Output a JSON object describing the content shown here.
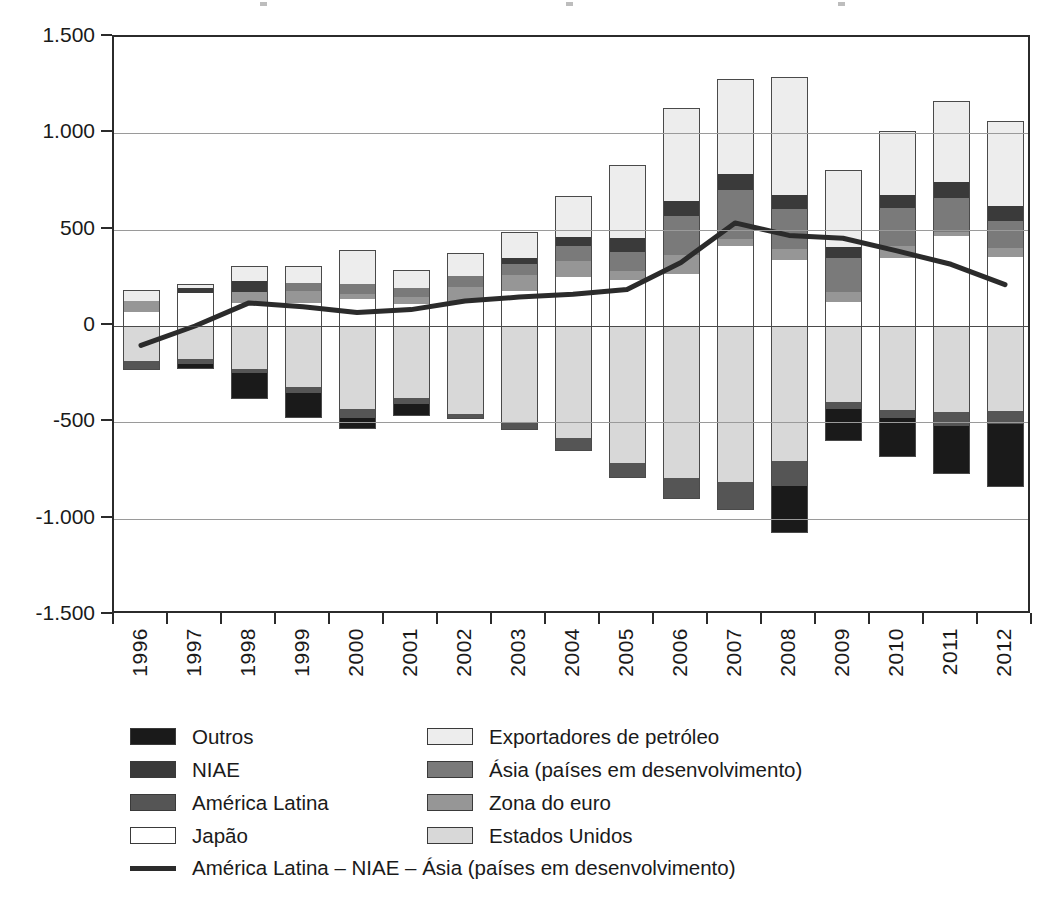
{
  "chart_data": {
    "type": "bar",
    "title": "",
    "subtitle": "",
    "xlabel": "",
    "ylabel": "",
    "ylim": [
      -1500,
      1500
    ],
    "ytick_step": 500,
    "ytick_labels": [
      "1.500",
      "1.000",
      "500",
      "0",
      "-500",
      "-1.000",
      "-1.500"
    ],
    "ytick_values": [
      1500,
      1000,
      500,
      0,
      -500,
      -1000,
      -1500
    ],
    "grid": true,
    "grid_axis": "y",
    "legend_position": "bottom",
    "stacked": true,
    "categories": [
      "1996",
      "1997",
      "1998",
      "1999",
      "2000",
      "2001",
      "2002",
      "2003",
      "2004",
      "2005",
      "2006",
      "2007",
      "2008",
      "2009",
      "2010",
      "2011",
      "2012"
    ],
    "series": [
      {
        "name": "Exportadores de petróleo",
        "color": "#ededed",
        "values": [
          55,
          25,
          75,
          85,
          175,
          95,
          120,
          135,
          215,
          380,
          480,
          490,
          610,
          400,
          330,
          425,
          440
        ]
      },
      {
        "name": "NIAE",
        "color": "#3a3a3a",
        "values": [
          0,
          25,
          60,
          0,
          0,
          0,
          0,
          35,
          45,
          70,
          80,
          85,
          75,
          55,
          70,
          80,
          80
        ]
      },
      {
        "name": "Ásia (países em desenvolvimento)",
        "color": "#7a7a7a",
        "values": [
          0,
          0,
          0,
          45,
          55,
          45,
          60,
          55,
          80,
          100,
          200,
          255,
          205,
          180,
          195,
          175,
          140
        ]
      },
      {
        "name": "Zona do euro",
        "color": "#969696",
        "values": [
          55,
          0,
          55,
          60,
          25,
          35,
          70,
          85,
          80,
          45,
          100,
          35,
          55,
          50,
          60,
          25,
          45
        ]
      },
      {
        "name": "Japão",
        "color": "#ffffff",
        "values": [
          75,
          170,
          120,
          120,
          140,
          115,
          130,
          180,
          255,
          240,
          270,
          415,
          345,
          125,
          355,
          465,
          360
        ]
      },
      {
        "name": "Estados Unidos",
        "color": "#d8d8d8",
        "values": [
          -180,
          -170,
          -225,
          -315,
          -430,
          -375,
          -455,
          -500,
          -580,
          -710,
          -790,
          -810,
          -700,
          -395,
          -435,
          -445,
          -440
        ]
      },
      {
        "name": "América Latina",
        "color": "#555555",
        "values": [
          -50,
          -25,
          -20,
          -35,
          -45,
          -30,
          -30,
          -40,
          -70,
          -80,
          -110,
          -145,
          -130,
          -35,
          -45,
          -75,
          -70
        ]
      },
      {
        "name": "Outros",
        "color": "#1a1a1a",
        "values": [
          0,
          -30,
          -135,
          -125,
          -60,
          -60,
          0,
          0,
          0,
          0,
          0,
          0,
          -245,
          -165,
          -200,
          -250,
          -325
        ]
      }
    ],
    "line_series": {
      "name": "América Latina – NIAE – Ásia (países em desenvolvimento)",
      "color": "#2b2b2b",
      "values": [
        -100,
        0,
        120,
        100,
        70,
        85,
        130,
        150,
        165,
        190,
        330,
        535,
        470,
        455,
        390,
        320,
        215
      ]
    }
  },
  "legend": {
    "left_items": [
      {
        "label": "Outros",
        "swatch": "legend-swatch-outros"
      },
      {
        "label": "NIAE",
        "swatch": "legend-swatch-niae"
      },
      {
        "label": "América Latina",
        "swatch": "legend-swatch-america-latina"
      },
      {
        "label": "Japão",
        "swatch": "legend-swatch-japao"
      }
    ],
    "right_items": [
      {
        "label": "Exportadores de petróleo",
        "swatch": "legend-swatch-exportadores"
      },
      {
        "label": "Ásia (países em desenvolvimento)",
        "swatch": "legend-swatch-asia"
      },
      {
        "label": "Zona do euro",
        "swatch": "legend-swatch-zona-euro"
      },
      {
        "label": "Estados Unidos",
        "swatch": "legend-swatch-estados-unidos"
      }
    ],
    "line_item": {
      "label": "América Latina – NIAE – Ásia (países em desenvolvimento)",
      "swatch": "legend-swatch-line"
    }
  }
}
